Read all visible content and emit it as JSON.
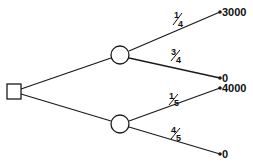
{
  "diagram": {
    "type": "decision-tree",
    "decision_node": {
      "shape": "square"
    },
    "chance_nodes": [
      {
        "id": "upper",
        "branches": [
          {
            "probability": {
              "num": "1",
              "den": "4"
            },
            "payoff": "3000"
          },
          {
            "probability": {
              "num": "3",
              "den": "4"
            },
            "payoff": "0"
          }
        ]
      },
      {
        "id": "lower",
        "branches": [
          {
            "probability": {
              "num": "1",
              "den": "5"
            },
            "payoff": "4000"
          },
          {
            "probability": {
              "num": "4",
              "den": "5"
            },
            "payoff": "0"
          }
        ]
      }
    ],
    "colors": {
      "line": "#1a1a1a",
      "background": "#ffffff"
    }
  }
}
